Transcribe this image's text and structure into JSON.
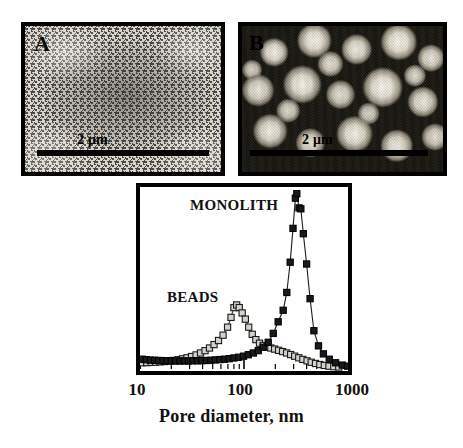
{
  "figure": {
    "panels": [
      {
        "id": "A",
        "label": "A",
        "caption_text": "",
        "scalebar": {
          "text": "2 μm",
          "length_um": 2
        }
      },
      {
        "id": "B",
        "label": "B",
        "caption_text": "",
        "scalebar": {
          "text": "2 μm",
          "length_um": 2
        }
      }
    ]
  },
  "chart_data": {
    "type": "line",
    "title": "",
    "xlabel": "Pore diameter, nm",
    "ylabel": "",
    "xscale": "log",
    "xlim": [
      10,
      1000
    ],
    "ylim": [
      0,
      1.0
    ],
    "xticks": [
      10,
      100,
      1000
    ],
    "xtick_labels": [
      "10",
      "100",
      "1000"
    ],
    "yticks": [],
    "grid": false,
    "legend_position": "inline-annotations",
    "annotations": [
      {
        "text": "MONOLITH",
        "x": 180,
        "y": 0.9
      },
      {
        "text": "BEADS",
        "x": 45,
        "y": 0.55
      }
    ],
    "series": [
      {
        "name": "MONOLITH",
        "marker": "square",
        "marker_fill": "#1a1a1a",
        "marker_edge": "#000000",
        "line_color": "#1a1a1a",
        "points": [
          {
            "x": 10.5,
            "y": 0.055
          },
          {
            "x": 11.5,
            "y": 0.052
          },
          {
            "x": 12.6,
            "y": 0.05
          },
          {
            "x": 13.8,
            "y": 0.049
          },
          {
            "x": 15.1,
            "y": 0.048
          },
          {
            "x": 16.6,
            "y": 0.047
          },
          {
            "x": 18.2,
            "y": 0.046
          },
          {
            "x": 20.0,
            "y": 0.046
          },
          {
            "x": 22.0,
            "y": 0.045
          },
          {
            "x": 24.2,
            "y": 0.045
          },
          {
            "x": 26.6,
            "y": 0.045
          },
          {
            "x": 29.3,
            "y": 0.045
          },
          {
            "x": 32.3,
            "y": 0.046
          },
          {
            "x": 35.6,
            "y": 0.046
          },
          {
            "x": 39.3,
            "y": 0.047
          },
          {
            "x": 43.4,
            "y": 0.048
          },
          {
            "x": 47.9,
            "y": 0.049
          },
          {
            "x": 53.0,
            "y": 0.051
          },
          {
            "x": 58.7,
            "y": 0.053
          },
          {
            "x": 65.0,
            "y": 0.055
          },
          {
            "x": 72.0,
            "y": 0.058
          },
          {
            "x": 80.0,
            "y": 0.062
          },
          {
            "x": 89.0,
            "y": 0.066
          },
          {
            "x": 99.0,
            "y": 0.072
          },
          {
            "x": 110.0,
            "y": 0.08
          },
          {
            "x": 123.0,
            "y": 0.09
          },
          {
            "x": 137.0,
            "y": 0.103
          },
          {
            "x": 153.0,
            "y": 0.122
          },
          {
            "x": 171.0,
            "y": 0.15
          },
          {
            "x": 191.0,
            "y": 0.2
          },
          {
            "x": 213.0,
            "y": 0.265
          },
          {
            "x": 238.0,
            "y": 0.33
          },
          {
            "x": 258.0,
            "y": 0.43
          },
          {
            "x": 278.0,
            "y": 0.6
          },
          {
            "x": 296.0,
            "y": 0.79
          },
          {
            "x": 312.0,
            "y": 0.96
          },
          {
            "x": 322.0,
            "y": 0.985
          },
          {
            "x": 338.0,
            "y": 0.905
          },
          {
            "x": 352.0,
            "y": 0.9
          },
          {
            "x": 372.0,
            "y": 0.76
          },
          {
            "x": 400.0,
            "y": 0.59
          },
          {
            "x": 432.0,
            "y": 0.395
          },
          {
            "x": 470.0,
            "y": 0.215
          },
          {
            "x": 520.0,
            "y": 0.13
          },
          {
            "x": 580.0,
            "y": 0.085
          },
          {
            "x": 660.0,
            "y": 0.055
          },
          {
            "x": 760.0,
            "y": 0.035
          },
          {
            "x": 880.0,
            "y": 0.022
          },
          {
            "x": 990.0,
            "y": 0.016
          }
        ]
      },
      {
        "name": "BEADS",
        "marker": "square",
        "marker_fill": "#d5d2cb",
        "marker_edge": "#1a1a1a",
        "line_color": "#3a3a3a",
        "points": [
          {
            "x": 10.5,
            "y": 0.035
          },
          {
            "x": 11.6,
            "y": 0.036
          },
          {
            "x": 12.8,
            "y": 0.037
          },
          {
            "x": 14.1,
            "y": 0.038
          },
          {
            "x": 15.6,
            "y": 0.04
          },
          {
            "x": 17.2,
            "y": 0.042
          },
          {
            "x": 19.0,
            "y": 0.045
          },
          {
            "x": 21.0,
            "y": 0.048
          },
          {
            "x": 23.2,
            "y": 0.052
          },
          {
            "x": 25.6,
            "y": 0.057
          },
          {
            "x": 28.3,
            "y": 0.063
          },
          {
            "x": 31.3,
            "y": 0.07
          },
          {
            "x": 34.6,
            "y": 0.079
          },
          {
            "x": 38.2,
            "y": 0.09
          },
          {
            "x": 42.2,
            "y": 0.103
          },
          {
            "x": 46.6,
            "y": 0.118
          },
          {
            "x": 51.5,
            "y": 0.137
          },
          {
            "x": 56.9,
            "y": 0.16
          },
          {
            "x": 62.9,
            "y": 0.19
          },
          {
            "x": 69.5,
            "y": 0.235
          },
          {
            "x": 75.0,
            "y": 0.29
          },
          {
            "x": 80.0,
            "y": 0.345
          },
          {
            "x": 85.0,
            "y": 0.36
          },
          {
            "x": 90.0,
            "y": 0.345
          },
          {
            "x": 96.0,
            "y": 0.315
          },
          {
            "x": 103.0,
            "y": 0.28
          },
          {
            "x": 111.0,
            "y": 0.235
          },
          {
            "x": 120.0,
            "y": 0.195
          },
          {
            "x": 130.0,
            "y": 0.165
          },
          {
            "x": 141.0,
            "y": 0.145
          },
          {
            "x": 153.0,
            "y": 0.132
          },
          {
            "x": 166.0,
            "y": 0.124
          },
          {
            "x": 181.0,
            "y": 0.118
          },
          {
            "x": 197.0,
            "y": 0.112
          },
          {
            "x": 215.0,
            "y": 0.105
          },
          {
            "x": 235.0,
            "y": 0.098
          },
          {
            "x": 257.0,
            "y": 0.09
          },
          {
            "x": 281.0,
            "y": 0.081
          },
          {
            "x": 307.0,
            "y": 0.072
          },
          {
            "x": 336.0,
            "y": 0.063
          },
          {
            "x": 368.0,
            "y": 0.054
          },
          {
            "x": 404.0,
            "y": 0.046
          },
          {
            "x": 443.0,
            "y": 0.038
          },
          {
            "x": 487.0,
            "y": 0.031
          },
          {
            "x": 536.0,
            "y": 0.025
          },
          {
            "x": 592.0,
            "y": 0.02
          },
          {
            "x": 656.0,
            "y": 0.016
          },
          {
            "x": 730.0,
            "y": 0.013
          },
          {
            "x": 815.0,
            "y": 0.011
          }
        ]
      }
    ]
  }
}
